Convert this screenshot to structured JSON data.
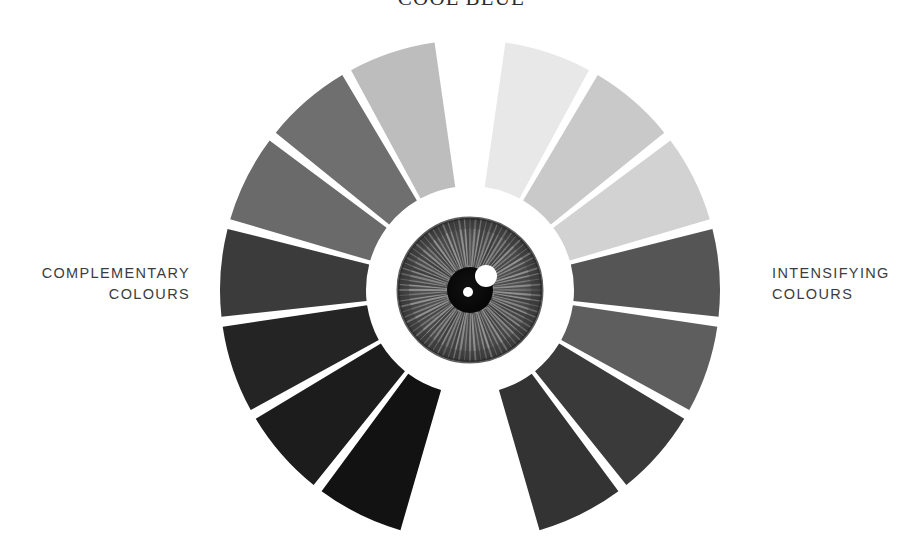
{
  "page": {
    "title": "COOL BLUE",
    "background_color": "#ffffff",
    "width": 923,
    "height": 554
  },
  "labels": {
    "left": {
      "line1": "COMPLEMENTARY",
      "line2": "COLOURS"
    },
    "right": {
      "line1": "INTENSIFYING",
      "line2": "COLOURS"
    },
    "text_color": "#3c3c3c"
  },
  "chart_data": {
    "type": "pie",
    "title": "COOL BLUE",
    "subtitle": "",
    "xlabel": "",
    "ylabel": "",
    "legend_position": "sides",
    "grid": false,
    "geometry": {
      "center_x": 470,
      "center_y": 290,
      "inner_radius": 104,
      "outer_radius": 250,
      "top_gap_degrees": 14,
      "bottom_gap_degrees": 30,
      "separator_color": "#ffffff",
      "separator_width": 4
    },
    "eye": {
      "iris_radius": 72,
      "pupil_radius": 23,
      "pupil_color": "#0a0a0a",
      "iris_base_color": "#6b6b6b",
      "iris_rim_color": "#3a3a3a",
      "highlight_large": {
        "cx": 486,
        "cy": 276,
        "r": 11,
        "color": "#ffffff"
      },
      "highlight_small": {
        "cx": 468,
        "cy": 292,
        "r": 5,
        "color": "#ffffff"
      }
    },
    "series": [
      {
        "name": "INTENSIFYING COLOURS",
        "side": "right",
        "categories": [
          "R1",
          "R2",
          "R3",
          "R4",
          "R5",
          "R6",
          "R7"
        ],
        "values": [
          1,
          1,
          1,
          1,
          1,
          1,
          1
        ],
        "colors": [
          "#e8e8e8",
          "#c9c9c9",
          "#d2d2d2",
          "#555555",
          "#5e5e5e",
          "#3a3a3a",
          "#333333"
        ],
        "luminance": [
          232,
          201,
          210,
          85,
          94,
          58,
          51
        ]
      },
      {
        "name": "COMPLEMENTARY COLOURS",
        "side": "left",
        "categories": [
          "L1",
          "L2",
          "L3",
          "L4",
          "L5",
          "L6",
          "L7"
        ],
        "values": [
          1,
          1,
          1,
          1,
          1,
          1,
          1
        ],
        "colors": [
          "#bdbdbd",
          "#6f6f6f",
          "#6a6a6a",
          "#3b3b3b",
          "#242424",
          "#1c1c1c",
          "#121212"
        ],
        "luminance": [
          189,
          111,
          106,
          59,
          36,
          28,
          18
        ]
      }
    ]
  },
  "icons": {
    "eye": "eye-icon",
    "iris": "iris-icon",
    "pupil": "pupil-icon"
  }
}
